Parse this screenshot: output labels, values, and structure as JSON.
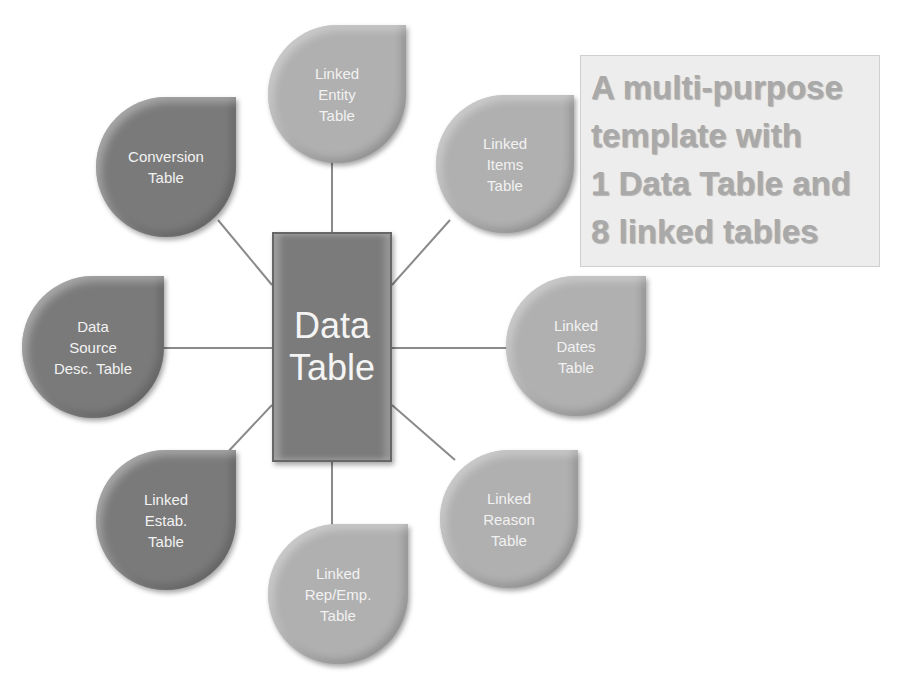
{
  "diagram": {
    "center": {
      "label": "Data\nTable",
      "color": "#7b7b7b"
    },
    "callout": {
      "text": "A multi-purpose\ntemplate with\n1 Data Table and\n8 linked tables",
      "text_color": "#a9a9a9",
      "background": "#ededed"
    },
    "nodes": [
      {
        "id": "entity",
        "label": "Linked\nEntity\nTable",
        "shade": "light",
        "color": "#b0b0b0"
      },
      {
        "id": "conversion",
        "label": "Conversion\nTable",
        "shade": "dark",
        "color": "#7a7a7a"
      },
      {
        "id": "items",
        "label": "Linked\nItems\nTable",
        "shade": "light",
        "color": "#b0b0b0"
      },
      {
        "id": "data-source",
        "label": "Data\nSource\nDesc. Table",
        "shade": "dark",
        "color": "#7a7a7a"
      },
      {
        "id": "dates",
        "label": "Linked\nDates\nTable",
        "shade": "light",
        "color": "#b0b0b0"
      },
      {
        "id": "estab",
        "label": "Linked\nEstab.\nTable",
        "shade": "dark",
        "color": "#7a7a7a"
      },
      {
        "id": "reason",
        "label": "Linked\nReason\nTable",
        "shade": "light",
        "color": "#b0b0b0"
      },
      {
        "id": "rep-emp",
        "label": "Linked\nRep/Emp.\nTable",
        "shade": "light",
        "color": "#b0b0b0"
      }
    ],
    "connector_color": "#8a8a8a"
  }
}
